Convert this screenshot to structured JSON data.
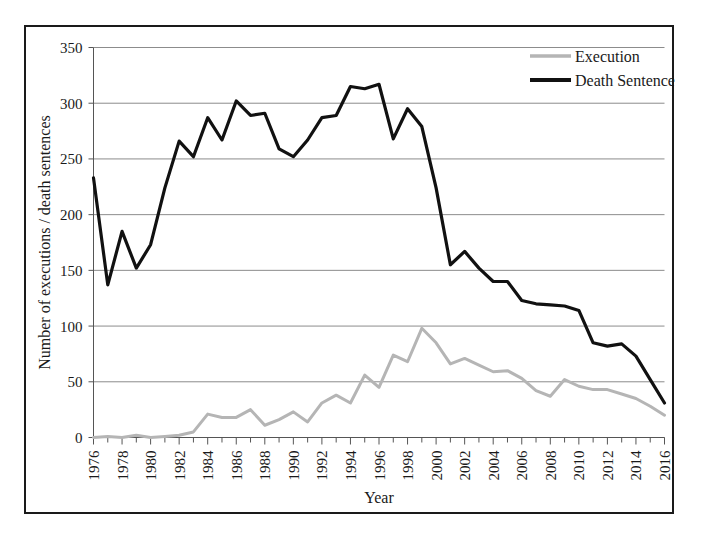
{
  "chart_data": {
    "type": "line",
    "title": "",
    "xlabel": "Year",
    "ylabel": "Number of executions / death sentences",
    "xlim": [
      1976,
      2016
    ],
    "ylim": [
      0,
      350
    ],
    "yticks": [
      0,
      50,
      100,
      150,
      200,
      250,
      300,
      350
    ],
    "ytick_labels": [
      "0",
      "50",
      "100",
      "150",
      "200",
      "250",
      "300",
      "350"
    ],
    "xticks": [
      1976,
      1978,
      1980,
      1982,
      1984,
      1986,
      1988,
      1990,
      1992,
      1994,
      1996,
      1998,
      2000,
      2002,
      2004,
      2006,
      2008,
      2010,
      2012,
      2014,
      2016
    ],
    "xtick_labels": [
      "1976",
      "1978",
      "1980",
      "1982",
      "1984",
      "1986",
      "1988",
      "1990",
      "1992",
      "1994",
      "1996",
      "1998",
      "2000",
      "2002",
      "2004",
      "2006",
      "2008",
      "2010",
      "2012",
      "2014",
      "2016"
    ],
    "x": [
      1976,
      1977,
      1978,
      1979,
      1980,
      1981,
      1982,
      1983,
      1984,
      1985,
      1986,
      1987,
      1988,
      1989,
      1990,
      1991,
      1992,
      1993,
      1994,
      1995,
      1996,
      1997,
      1998,
      1999,
      2000,
      2001,
      2002,
      2003,
      2004,
      2005,
      2006,
      2007,
      2008,
      2009,
      2010,
      2011,
      2012,
      2013,
      2014,
      2015,
      2016
    ],
    "grid": "horizontal",
    "legend_position": "top-right",
    "series": [
      {
        "name": "Execution",
        "color": "#b5b5b5",
        "values": [
          0,
          1,
          0,
          2,
          0,
          1,
          2,
          5,
          21,
          18,
          18,
          25,
          11,
          16,
          23,
          14,
          31,
          38,
          31,
          56,
          45,
          74,
          68,
          98,
          85,
          66,
          71,
          65,
          59,
          60,
          53,
          42,
          37,
          52,
          46,
          43,
          43,
          39,
          35,
          28,
          20
        ]
      },
      {
        "name": "Death Sentence",
        "color": "#111111",
        "values": [
          233,
          137,
          185,
          152,
          173,
          224,
          266,
          252,
          287,
          267,
          302,
          289,
          291,
          259,
          252,
          267,
          287,
          289,
          315,
          313,
          317,
          268,
          295,
          279,
          224,
          155,
          167,
          152,
          140,
          140,
          123,
          120,
          119,
          118,
          114,
          85,
          82,
          84,
          73,
          52,
          31
        ]
      }
    ]
  },
  "legend": {
    "items": [
      {
        "label": "Execution",
        "color": "#b5b5b5"
      },
      {
        "label": "Death Sentence",
        "color": "#111111"
      }
    ]
  },
  "axes": {
    "x_title": "Year",
    "y_title": "Number of executions / death sentences"
  }
}
